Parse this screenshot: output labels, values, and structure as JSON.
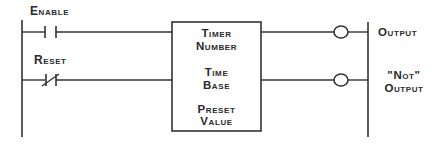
{
  "diagram": {
    "type": "ladder-logic-timer",
    "colors": {
      "line": "#333333",
      "text": "#2a2a2a",
      "background": "#ffffff"
    },
    "inputs": [
      {
        "label": "Enable",
        "contact": "normally-open"
      },
      {
        "label": "Reset",
        "contact": "normally-closed"
      }
    ],
    "timer_block": {
      "lines": [
        "Timer",
        "Number",
        "Time",
        "Base",
        "Preset",
        "Value"
      ]
    },
    "outputs": [
      {
        "label_lines": [
          "Output"
        ]
      },
      {
        "label_lines": [
          "\"Not\"",
          "Output"
        ]
      }
    ]
  }
}
